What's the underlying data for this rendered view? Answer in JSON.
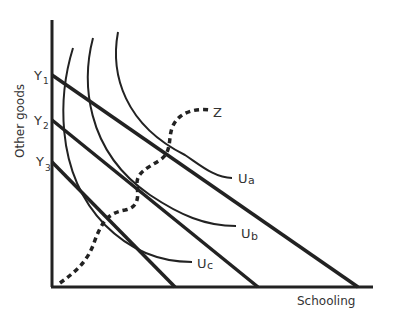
{
  "diagram": {
    "type": "indifference-curves-budget-lines",
    "y_axis_label": "Other goods",
    "x_axis_label": "Schooling",
    "budget_lines": [
      {
        "name": "Y1",
        "label": "Y",
        "subscript": "1"
      },
      {
        "name": "Y2",
        "label": "Y",
        "subscript": "2"
      },
      {
        "name": "Y3",
        "label": "Y",
        "subscript": "3"
      }
    ],
    "indifference_curves": [
      {
        "name": "Ua",
        "label": "U",
        "subscript": "a"
      },
      {
        "name": "Ub",
        "label": "U",
        "subscript": "b"
      },
      {
        "name": "Uc",
        "label": "U",
        "subscript": "c"
      }
    ],
    "expansion_path": {
      "name": "Z",
      "label": "Z",
      "style": "dashed"
    },
    "colors": {
      "ink": "#222222",
      "text": "#333333",
      "background": "#ffffff"
    }
  }
}
